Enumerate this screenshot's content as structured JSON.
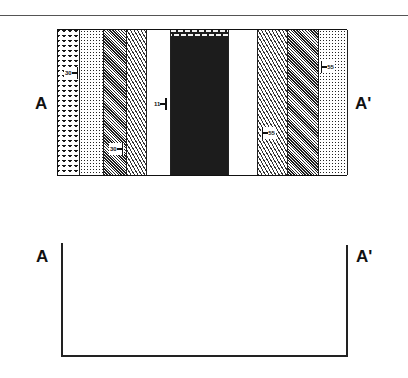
{
  "figure": {
    "type": "geologic map and cross-section exercise",
    "map": {
      "left_label": "A",
      "right_label": "A'",
      "bands": [
        {
          "id": "band-1",
          "pattern": "chevron-dark",
          "x": 0,
          "width": 22
        },
        {
          "id": "band-2",
          "pattern": "dots",
          "x": 22,
          "width": 24
        },
        {
          "id": "band-3",
          "pattern": "dense-diagonal",
          "x": 46,
          "width": 23
        },
        {
          "id": "band-4",
          "pattern": "diagonal",
          "x": 69,
          "width": 20
        },
        {
          "id": "band-5",
          "pattern": "white",
          "x": 89,
          "width": 24
        },
        {
          "id": "band-6",
          "pattern": "brick",
          "x": 113,
          "width": 58
        },
        {
          "id": "band-7",
          "pattern": "white",
          "x": 171,
          "width": 29
        },
        {
          "id": "band-8",
          "pattern": "diagonal",
          "x": 200,
          "width": 30
        },
        {
          "id": "band-9",
          "pattern": "dense-diagonal",
          "x": 230,
          "width": 31
        },
        {
          "id": "band-10",
          "pattern": "dots",
          "x": 261,
          "width": 29
        }
      ],
      "dip_symbols": [
        {
          "value": "30",
          "side": "label-left",
          "x": 8,
          "y": 38
        },
        {
          "value": "30",
          "side": "label-left",
          "x": 52,
          "y": 114
        },
        {
          "value": "11",
          "side": "label-left",
          "x": 95,
          "y": 70
        },
        {
          "value": "55",
          "side": "label-right",
          "x": 204,
          "y": 99
        },
        {
          "value": "55",
          "side": "label-right",
          "x": 262,
          "y": 32
        }
      ]
    },
    "profile": {
      "left_label": "A",
      "right_label": "A'"
    }
  }
}
